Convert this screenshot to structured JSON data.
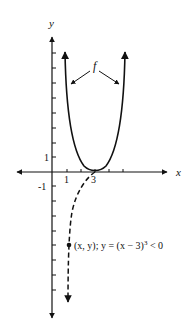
{
  "diagram": {
    "type": "function-graph",
    "axes": {
      "x_label": "x",
      "y_label": "y",
      "x_ticks_labeled": [
        "1",
        "3"
      ],
      "y_ticks_labeled": [
        "1",
        "-1"
      ]
    },
    "curve_label": "f",
    "point_label_prefix": "(x, y); y = (x − 3)",
    "point_label_exp": "3",
    "point_label_suffix": " < 0",
    "colors": {
      "ink": "#111111",
      "background": "#ffffff"
    }
  }
}
